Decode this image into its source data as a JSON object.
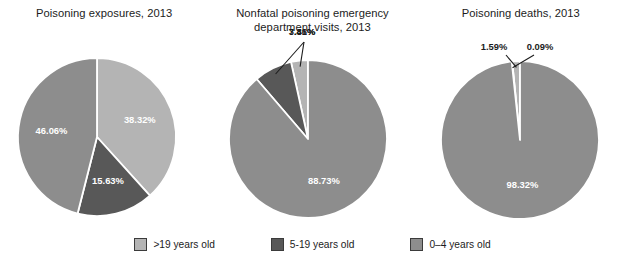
{
  "colors": {
    "gt19": "#b4b4b4",
    "age5to19": "#585858",
    "age0to4": "#8d8d8d",
    "background": "#ffffff",
    "text": "#1c1c1c",
    "slice_label": "#ffffff",
    "divider": "#ffffff"
  },
  "legend": {
    "items": [
      {
        "label": ">19 years old",
        "color_key": "gt19"
      },
      {
        "label": "5-19 years old",
        "color_key": "age5to19"
      },
      {
        "label": "0–4 years old",
        "color_key": "age0to4"
      }
    ]
  },
  "chart_data": [
    {
      "type": "pie",
      "title": "Poisoning exposures, 2013",
      "categories": [
        ">19 years old",
        "5-19 years old",
        "0–4 years old"
      ],
      "values": [
        38.32,
        15.63,
        46.06
      ],
      "labels": [
        "38.32%",
        "15.63%",
        "46.06%"
      ],
      "colors": [
        "#b4b4b4",
        "#585858",
        "#8d8d8d"
      ],
      "start_angle_deg": 0,
      "direction": "clockwise",
      "legend_position": "bottom",
      "units": "percent"
    },
    {
      "type": "pie",
      "title": "Nonfatal poisoning emergency\ndepartment visits, 2013",
      "categories": [
        ">19 years old",
        "5-19 years old",
        "0–4 years old"
      ],
      "values": [
        3.46,
        7.81,
        88.73
      ],
      "labels": [
        "3.46%",
        "7.81%",
        "88.73%"
      ],
      "colors": [
        "#b4b4b4",
        "#585858",
        "#8d8d8d"
      ],
      "start_angle_deg": 0,
      "direction": "counterclockwise",
      "legend_position": "bottom",
      "units": "percent"
    },
    {
      "type": "pie",
      "title": "Poisoning deaths, 2013",
      "categories": [
        ">19 years old",
        "5-19 years old",
        "0–4 years old"
      ],
      "values": [
        1.59,
        0.09,
        98.32
      ],
      "labels": [
        "1.59%",
        "0.09%",
        "98.32%"
      ],
      "colors": [
        "#b4b4b4",
        "#585858",
        "#8d8d8d"
      ],
      "start_angle_deg": 0,
      "direction": "counterclockwise",
      "legend_position": "bottom",
      "units": "percent"
    }
  ]
}
